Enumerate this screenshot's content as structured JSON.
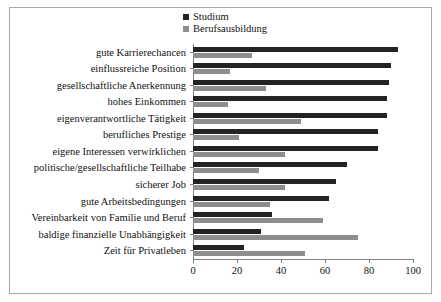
{
  "chart_data": {
    "type": "bar",
    "orientation": "horizontal",
    "title": "",
    "subtitle": "",
    "xlabel": "",
    "ylabel": "",
    "xlim": [
      0,
      100
    ],
    "xticks": [
      0,
      20,
      40,
      60,
      80,
      100
    ],
    "xtick_labels": [
      "0",
      "20",
      "40",
      "60",
      "80",
      "100"
    ],
    "grid": false,
    "legend_position": "top-center",
    "categories": [
      "gute Karrierechancen",
      "einflussreiche Position",
      "gesellschaftliche Anerkennung",
      "hohes Einkommen",
      "eigenverantwortliche Tätigkeit",
      "berufliches Prestige",
      "eigene Interessen verwirklichen",
      "politische/gesellschaftliche Teilhabe",
      "sicherer Job",
      "gute Arbeitsbedingungen",
      "Vereinbarkeit von Familie und Beruf",
      "baldige finanzielle Unabhängigkeit",
      "Zeit für Privatleben"
    ],
    "series": [
      {
        "name": "Studium",
        "color": "#232323",
        "values": [
          93,
          90,
          89,
          88,
          88,
          84,
          84,
          70,
          65,
          62,
          36,
          31,
          23
        ]
      },
      {
        "name": "Berufsausbildung",
        "color": "#8e8e8e",
        "values": [
          27,
          17,
          33,
          16,
          49,
          21,
          42,
          30,
          42,
          35,
          59,
          75,
          51
        ]
      }
    ]
  },
  "legend": {
    "items": [
      {
        "label": "Studium",
        "color": "#232323"
      },
      {
        "label": "Berufsausbildung",
        "color": "#8e8e8e"
      }
    ]
  }
}
